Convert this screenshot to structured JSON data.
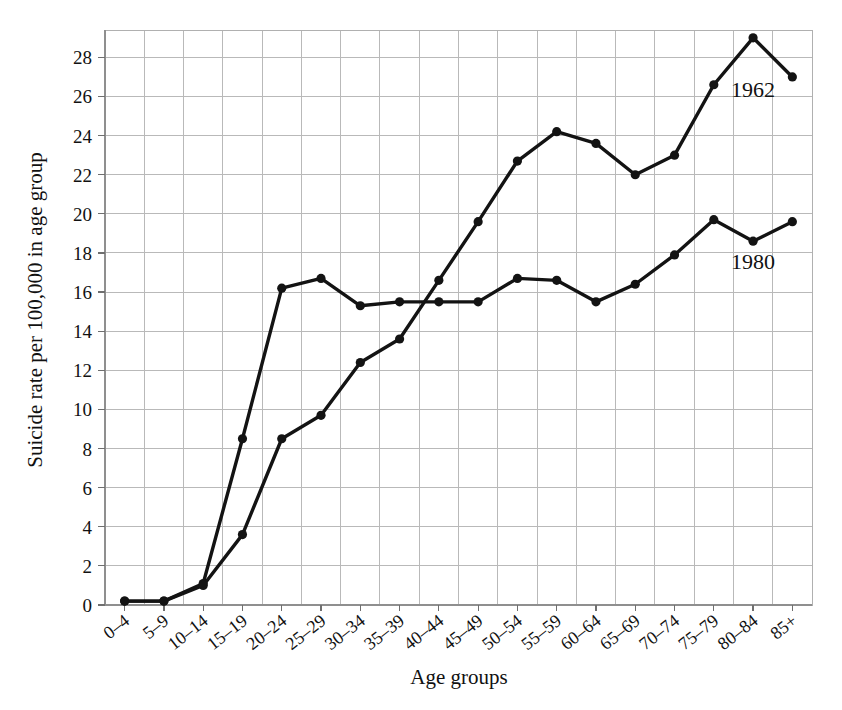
{
  "chart_data": {
    "type": "line",
    "title": "",
    "xlabel": "Age groups",
    "ylabel": "Suicide rate per 100,000 in age group",
    "categories": [
      "0–4",
      "5–9",
      "10–14",
      "15–19",
      "20–24",
      "25–29",
      "30–34",
      "35–39",
      "40–44",
      "45–49",
      "50–54",
      "55–59",
      "60–64",
      "65–69",
      "70–74",
      "75–79",
      "80–84",
      "85+"
    ],
    "series": [
      {
        "name": "1962",
        "values": [
          0.2,
          0.2,
          1.1,
          8.5,
          16.2,
          16.7,
          15.3,
          15.5,
          15.5,
          15.5,
          16.7,
          16.6,
          15.5,
          16.4,
          17.9,
          19.7,
          18.6,
          19.6
        ]
      },
      {
        "name": "1980",
        "values": [
          0.2,
          0.2,
          1.0,
          3.6,
          8.5,
          9.7,
          12.4,
          13.6,
          16.6,
          19.6,
          22.7,
          24.2,
          23.6,
          22.0,
          23.0,
          26.6,
          29.0,
          27.0
        ]
      }
    ],
    "ylim": [
      0,
      29.4
    ],
    "yticks": [
      0,
      2,
      4,
      6,
      8,
      10,
      12,
      14,
      16,
      18,
      20,
      22,
      24,
      26,
      28
    ],
    "ytick_labels": [
      "0",
      "2",
      "4",
      "6",
      "8",
      "10",
      "12",
      "14",
      "16",
      "18",
      "20",
      "22",
      "24",
      "26",
      "28"
    ],
    "grid": true,
    "legend_position": "inline-annotations",
    "annotations": [
      {
        "text": "1962",
        "category": "80–84",
        "value": 26.0,
        "series": "upper-curve-label"
      },
      {
        "text": "1980",
        "category": "80–84",
        "value": 17.2,
        "series": "lower-curve-label"
      }
    ],
    "colors": {
      "series_line": "#131313",
      "grid": "#b9b9b9",
      "frame": "#b0b0b0",
      "background": "#ffffff"
    }
  }
}
